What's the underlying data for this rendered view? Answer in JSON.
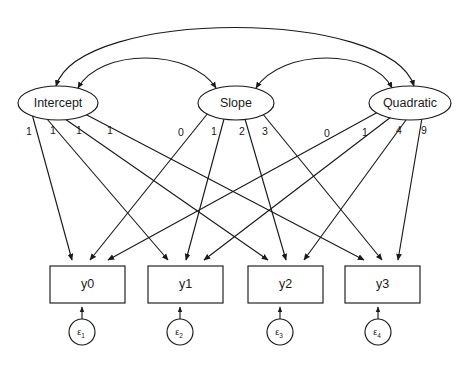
{
  "diagram": {
    "type": "sem-path-diagram",
    "background_color": "#ffffff",
    "stroke_color": "#1a1a1a"
  },
  "latent_factors": [
    {
      "id": "intercept",
      "label": "Intercept",
      "cx": 58,
      "cy": 103,
      "rx": 40,
      "ry": 17
    },
    {
      "id": "slope",
      "label": "Slope",
      "cx": 236,
      "cy": 103,
      "rx": 38,
      "ry": 17
    },
    {
      "id": "quadratic",
      "label": "Quadratic",
      "cx": 410,
      "cy": 103,
      "rx": 41,
      "ry": 17
    }
  ],
  "observed_variables": [
    {
      "id": "y0",
      "label": "y0",
      "x": 50,
      "y": 266,
      "w": 75,
      "h": 37
    },
    {
      "id": "y1",
      "label": "y1",
      "x": 148,
      "y": 266,
      "w": 75,
      "h": 37
    },
    {
      "id": "y2",
      "label": "y2",
      "x": 248,
      "y": 266,
      "w": 75,
      "h": 37
    },
    {
      "id": "y3",
      "label": "y3",
      "x": 345,
      "y": 266,
      "w": 75,
      "h": 37
    }
  ],
  "error_terms": [
    {
      "id": "e1",
      "symbol": "ε",
      "subscript": "1",
      "cx": 82,
      "cy": 332,
      "r": 13
    },
    {
      "id": "e2",
      "symbol": "ε",
      "subscript": "2",
      "cx": 180,
      "cy": 332,
      "r": 13
    },
    {
      "id": "e3",
      "symbol": "ε",
      "subscript": "3",
      "cx": 280,
      "cy": 332,
      "r": 13
    },
    {
      "id": "e4",
      "symbol": "ε",
      "subscript": "4",
      "cx": 378,
      "cy": 332,
      "r": 13
    }
  ],
  "loadings": {
    "intercept": {
      "from": "intercept",
      "values": [
        "1",
        "1",
        "1",
        "1"
      ],
      "label_positions": [
        {
          "text": "1",
          "x": 29,
          "y": 132
        },
        {
          "text": "1",
          "x": 53,
          "y": 131
        },
        {
          "text": "1",
          "x": 79,
          "y": 131
        },
        {
          "text": "1",
          "x": 110,
          "y": 131
        }
      ]
    },
    "slope": {
      "from": "slope",
      "values": [
        "0",
        "1",
        "2",
        "3"
      ],
      "label_positions": [
        {
          "text": "0",
          "x": 181,
          "y": 133
        },
        {
          "text": "1",
          "x": 214,
          "y": 132
        },
        {
          "text": "2",
          "x": 242,
          "y": 132
        },
        {
          "text": "3",
          "x": 265,
          "y": 132
        }
      ]
    },
    "quadratic": {
      "from": "quadratic",
      "values": [
        "0",
        "1",
        "4",
        "9"
      ],
      "label_positions": [
        {
          "text": "0",
          "x": 327,
          "y": 134
        },
        {
          "text": "1",
          "x": 365,
          "y": 133
        },
        {
          "text": "4",
          "x": 399,
          "y": 131
        },
        {
          "text": "9",
          "x": 424,
          "y": 131
        }
      ]
    }
  },
  "covariances": [
    {
      "id": "cov-intercept-slope",
      "from": "intercept",
      "to": "slope",
      "arc": "inner-left",
      "double_headed": true
    },
    {
      "id": "cov-slope-quadratic",
      "from": "slope",
      "to": "quadratic",
      "arc": "inner-right",
      "double_headed": true
    },
    {
      "id": "cov-intercept-quadratic",
      "from": "intercept",
      "to": "quadratic",
      "arc": "outer",
      "double_headed": true
    }
  ],
  "error_paths": [
    {
      "from": "e1",
      "to": "y0"
    },
    {
      "from": "e2",
      "to": "y1"
    },
    {
      "from": "e3",
      "to": "y2"
    },
    {
      "from": "e4",
      "to": "y3"
    }
  ]
}
